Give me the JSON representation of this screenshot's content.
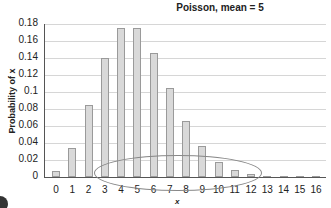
{
  "chart_data": {
    "type": "bar",
    "title": "Poisson, mean = 5",
    "xlabel": "x",
    "ylabel": "Probability of x",
    "ylim": [
      0,
      0.18
    ],
    "yticks": [
      "0",
      "0.02",
      "0.04",
      "0.06",
      "0.08",
      "0.1",
      "0.12",
      "0.14",
      "0.16",
      "0.18"
    ],
    "categories": [
      "0",
      "1",
      "2",
      "3",
      "4",
      "5",
      "6",
      "7",
      "8",
      "9",
      "10",
      "11",
      "12",
      "13",
      "14",
      "15",
      "16"
    ],
    "values": [
      0.0067,
      0.0337,
      0.0842,
      0.1404,
      0.1755,
      0.1755,
      0.1462,
      0.1044,
      0.0653,
      0.0363,
      0.0181,
      0.0082,
      0.0034,
      0.0013,
      0.0005,
      0.0002,
      0.0001
    ],
    "grid": true,
    "legend": null,
    "annotations": [
      "ellipse highlighting x = 3 to 12"
    ]
  }
}
